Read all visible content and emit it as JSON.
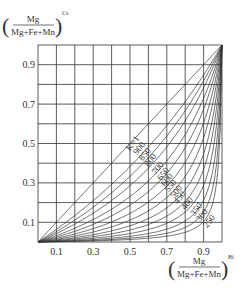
{
  "chart_data": {
    "type": "line",
    "title": "",
    "ylabel": {
      "numerator": "Mg",
      "denominator": "Mg+Fe+Mn",
      "superscript": "Cs"
    },
    "xlabel": {
      "numerator": "Mg",
      "denominator": "Mg+Fe+Mn",
      "superscript": "Bi"
    },
    "xlim": [
      0,
      1
    ],
    "ylim": [
      0,
      1
    ],
    "grid": true,
    "x_ticks": [
      "0.1",
      "0.3",
      "0.5",
      "0.7",
      "0.9"
    ],
    "x_tick_values": [
      0.1,
      0.3,
      0.5,
      0.7,
      0.9
    ],
    "y_ticks": [
      "0.1",
      "0.3",
      "0.5",
      "0.7",
      "0.9"
    ],
    "y_tick_values": [
      0.1,
      0.3,
      0.5,
      0.7,
      0.9
    ],
    "series": [
      {
        "name": "K=1",
        "K": 1.0
      },
      {
        "name": "900",
        "K": 0.62
      },
      {
        "name": "850",
        "K": 0.5
      },
      {
        "name": "800",
        "K": 0.4
      },
      {
        "name": "700",
        "K": 0.3
      },
      {
        "name": "650",
        "K": 0.23
      },
      {
        "name": "600",
        "K": 0.17
      },
      {
        "name": "550",
        "K": 0.125
      },
      {
        "name": "500",
        "K": 0.09
      },
      {
        "name": "450",
        "K": 0.065
      },
      {
        "name": "400",
        "K": 0.045
      },
      {
        "name": "350",
        "K": 0.03
      },
      {
        "name": "300",
        "K": 0.02
      },
      {
        "name": "250",
        "K": 0.013
      }
    ],
    "curve_formula": "y = K*x / (1 - x + K*x)"
  }
}
